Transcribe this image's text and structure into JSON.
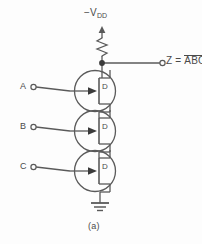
{
  "figure": {
    "caption": "(a)"
  },
  "supply": {
    "label_prefix": "−V",
    "label_subscript": "DD",
    "arrow_direction": "up"
  },
  "output": {
    "prefix": "Z = ",
    "expression": "ABC",
    "overbar": true,
    "terminal": "open-circle"
  },
  "inputs": [
    {
      "id": "a",
      "label": "A",
      "terminal": "open-circle"
    },
    {
      "id": "b",
      "label": "B",
      "terminal": "open-circle"
    },
    {
      "id": "c",
      "label": "C",
      "terminal": "open-circle"
    }
  ],
  "transistors": [
    {
      "id": "q1",
      "type": "fet",
      "channel_label": "D",
      "gate_input": "A"
    },
    {
      "id": "q2",
      "type": "fet",
      "channel_label": "D",
      "gate_input": "B"
    },
    {
      "id": "q3",
      "type": "fet",
      "channel_label": "D",
      "gate_input": "C"
    }
  ],
  "components": {
    "resistor": {
      "style": "zigzag",
      "orientation": "vertical"
    },
    "ground": {
      "style": "three-bar",
      "bars": 3
    },
    "junction_dot": {
      "present": true
    }
  },
  "colors": {
    "background": "#fdfdfd",
    "stroke": "#5a5a5a",
    "label": "#4a4a4a",
    "dot": "#3a3a3a"
  }
}
